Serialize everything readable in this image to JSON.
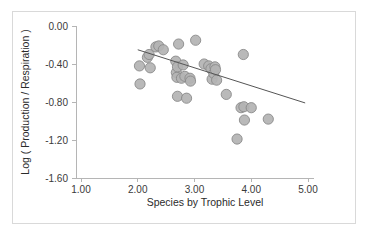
{
  "chart_data": {
    "type": "scatter",
    "title": "",
    "xlabel": "Species by Trophic Level",
    "ylabel": "Log ( Production / Respiration )",
    "xlim": [
      1.0,
      5.0
    ],
    "ylim": [
      -1.6,
      0.0
    ],
    "xticks": [
      "1.00",
      "2.00",
      "3.00",
      "4.00",
      "5.00"
    ],
    "yticks": [
      "0.00",
      "-0.40",
      "-0.80",
      "-1.20",
      "-1.60"
    ],
    "xtick_values": [
      1.0,
      2.0,
      3.0,
      4.0,
      5.0
    ],
    "ytick_values": [
      0.0,
      -0.4,
      -0.8,
      -1.2,
      -1.6
    ],
    "grid": false,
    "legend": null,
    "marker_color": "#b3b3b3",
    "marker_edge_color": "#8a8a8a",
    "trendline_color": "#555555",
    "frame_color": "#d9d9d9",
    "axis_color": "#b5b5b5",
    "points": [
      {
        "x": 2.03,
        "y": -0.42
      },
      {
        "x": 2.04,
        "y": -0.61
      },
      {
        "x": 2.17,
        "y": -0.33
      },
      {
        "x": 2.2,
        "y": -0.3
      },
      {
        "x": 2.22,
        "y": -0.44
      },
      {
        "x": 2.32,
        "y": -0.22
      },
      {
        "x": 2.37,
        "y": -0.21
      },
      {
        "x": 2.45,
        "y": -0.25
      },
      {
        "x": 2.67,
        "y": -0.37
      },
      {
        "x": 2.68,
        "y": -0.49
      },
      {
        "x": 2.69,
        "y": -0.54
      },
      {
        "x": 2.7,
        "y": -0.43
      },
      {
        "x": 2.7,
        "y": -0.74
      },
      {
        "x": 2.72,
        "y": -0.19
      },
      {
        "x": 2.77,
        "y": -0.55
      },
      {
        "x": 2.8,
        "y": -0.41
      },
      {
        "x": 2.83,
        "y": -0.53
      },
      {
        "x": 2.86,
        "y": -0.76
      },
      {
        "x": 2.92,
        "y": -0.55
      },
      {
        "x": 2.93,
        "y": -0.58
      },
      {
        "x": 3.02,
        "y": -0.15
      },
      {
        "x": 3.17,
        "y": -0.4
      },
      {
        "x": 3.25,
        "y": -0.42
      },
      {
        "x": 3.29,
        "y": -0.45
      },
      {
        "x": 3.31,
        "y": -0.56
      },
      {
        "x": 3.34,
        "y": -0.5
      },
      {
        "x": 3.36,
        "y": -0.43
      },
      {
        "x": 3.37,
        "y": -0.46
      },
      {
        "x": 3.39,
        "y": -0.57
      },
      {
        "x": 3.56,
        "y": -0.72
      },
      {
        "x": 3.75,
        "y": -1.19
      },
      {
        "x": 3.82,
        "y": -0.86
      },
      {
        "x": 3.86,
        "y": -0.3
      },
      {
        "x": 3.87,
        "y": -0.85
      },
      {
        "x": 3.88,
        "y": -0.99
      },
      {
        "x": 4.0,
        "y": -0.86
      },
      {
        "x": 4.3,
        "y": -0.98
      }
    ],
    "trendline": {
      "x_start": 2.0,
      "y_start": -0.25,
      "x_end": 4.95,
      "y_end": -0.81
    }
  }
}
